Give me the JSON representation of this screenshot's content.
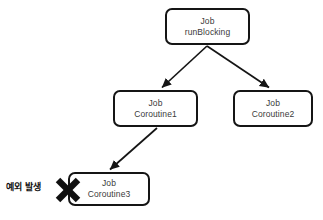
{
  "diagram": {
    "title_text_present": false,
    "background_color": "#ffffff",
    "stroke_color": "#151515",
    "text_color": "#3a3a3a",
    "nodes": [
      {
        "id": "runblocking",
        "line1": "Job",
        "line2": "runBlocking"
      },
      {
        "id": "coroutine1",
        "line1": "Job",
        "line2": "Coroutine1"
      },
      {
        "id": "coroutine2",
        "line1": "Job",
        "line2": "Coroutine2"
      },
      {
        "id": "coroutine3",
        "line1": "Job",
        "line2": "Coroutine3"
      }
    ],
    "annotation": {
      "label": "예외 발생",
      "marker_icon": "x-cross-icon",
      "marker_color": "#101010"
    },
    "edges": [
      {
        "from": "runblocking",
        "to": "coroutine1"
      },
      {
        "from": "runblocking",
        "to": "coroutine2"
      },
      {
        "from": "coroutine1",
        "to": "coroutine3"
      }
    ]
  }
}
